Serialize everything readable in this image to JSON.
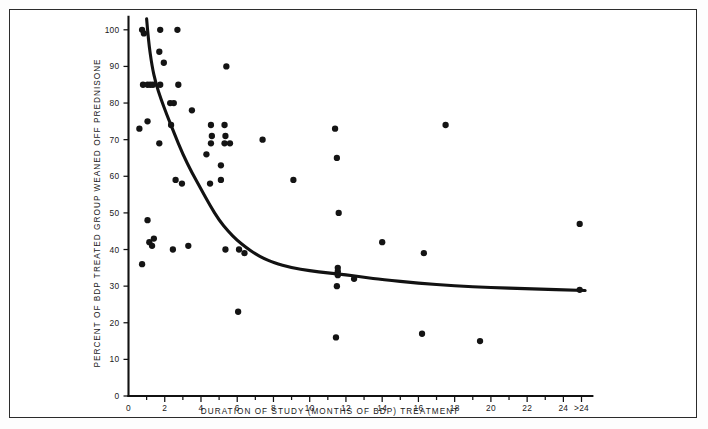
{
  "figure": {
    "border_color": "#2b2b2b",
    "background": "#ffffff",
    "point_color": "#141414",
    "line_color": "#121212"
  },
  "chart_data": {
    "type": "scatter",
    "title": "",
    "subtitle": "",
    "xlabel": "DURATION OF STUDY  (MONTHS OF BDP)  TREATMENT",
    "ylabel": "PERCENT OF BDP TREATED GROUP WEANED OFF PREDNISONE",
    "xlim": [
      0,
      26
    ],
    "ylim": [
      0,
      103
    ],
    "grid": false,
    "legend": null,
    "x_ticks": [
      0,
      1,
      2,
      3,
      4,
      5,
      6,
      7,
      8,
      9,
      10,
      11,
      12,
      13,
      14,
      15,
      16,
      17,
      18,
      19,
      20,
      21,
      22,
      23,
      24,
      25
    ],
    "x_tick_labels": [
      "0",
      "",
      "2",
      "",
      "4",
      "",
      "6",
      "",
      "8",
      "",
      "10",
      "",
      "12",
      "",
      "14",
      "",
      "16",
      "",
      "18",
      "",
      "20",
      "",
      "22",
      "",
      "24",
      ">24"
    ],
    "y_ticks": [
      0,
      10,
      20,
      30,
      40,
      50,
      60,
      70,
      80,
      90,
      100
    ],
    "y_tick_labels": [
      "0",
      "10",
      "20",
      "30",
      "40",
      "50",
      "60",
      "70",
      "80",
      "90",
      "100"
    ],
    "points": [
      {
        "x": 0.75,
        "y": 100
      },
      {
        "x": 0.85,
        "y": 99
      },
      {
        "x": 0.8,
        "y": 85
      },
      {
        "x": 1.05,
        "y": 85
      },
      {
        "x": 1.2,
        "y": 85
      },
      {
        "x": 1.35,
        "y": 85
      },
      {
        "x": 0.6,
        "y": 73
      },
      {
        "x": 1.05,
        "y": 75
      },
      {
        "x": 1.05,
        "y": 48
      },
      {
        "x": 1.15,
        "y": 42
      },
      {
        "x": 1.3,
        "y": 41
      },
      {
        "x": 1.4,
        "y": 43
      },
      {
        "x": 0.75,
        "y": 36
      },
      {
        "x": 1.75,
        "y": 100
      },
      {
        "x": 1.7,
        "y": 94
      },
      {
        "x": 1.95,
        "y": 91
      },
      {
        "x": 1.75,
        "y": 85
      },
      {
        "x": 1.7,
        "y": 69
      },
      {
        "x": 2.3,
        "y": 80
      },
      {
        "x": 2.5,
        "y": 80
      },
      {
        "x": 2.35,
        "y": 74
      },
      {
        "x": 2.7,
        "y": 100
      },
      {
        "x": 2.75,
        "y": 85
      },
      {
        "x": 2.6,
        "y": 59
      },
      {
        "x": 2.45,
        "y": 40
      },
      {
        "x": 2.95,
        "y": 58
      },
      {
        "x": 3.5,
        "y": 78
      },
      {
        "x": 3.3,
        "y": 41
      },
      {
        "x": 4.55,
        "y": 74
      },
      {
        "x": 4.6,
        "y": 71
      },
      {
        "x": 4.55,
        "y": 69
      },
      {
        "x": 4.5,
        "y": 58
      },
      {
        "x": 4.3,
        "y": 66
      },
      {
        "x": 5.4,
        "y": 90
      },
      {
        "x": 5.3,
        "y": 74
      },
      {
        "x": 5.35,
        "y": 71
      },
      {
        "x": 5.3,
        "y": 69
      },
      {
        "x": 5.1,
        "y": 63
      },
      {
        "x": 5.6,
        "y": 69
      },
      {
        "x": 5.1,
        "y": 59
      },
      {
        "x": 5.35,
        "y": 40
      },
      {
        "x": 6.1,
        "y": 40
      },
      {
        "x": 6.4,
        "y": 39
      },
      {
        "x": 6.05,
        "y": 23
      },
      {
        "x": 7.4,
        "y": 70
      },
      {
        "x": 9.1,
        "y": 59
      },
      {
        "x": 11.4,
        "y": 73
      },
      {
        "x": 11.5,
        "y": 65
      },
      {
        "x": 11.6,
        "y": 50
      },
      {
        "x": 11.55,
        "y": 35
      },
      {
        "x": 11.55,
        "y": 34
      },
      {
        "x": 11.55,
        "y": 33
      },
      {
        "x": 11.5,
        "y": 30
      },
      {
        "x": 11.45,
        "y": 16
      },
      {
        "x": 12.45,
        "y": 32
      },
      {
        "x": 14.0,
        "y": 42
      },
      {
        "x": 16.3,
        "y": 39
      },
      {
        "x": 16.2,
        "y": 17
      },
      {
        "x": 17.5,
        "y": 74
      },
      {
        "x": 19.4,
        "y": 15
      },
      {
        "x": 24.9,
        "y": 47
      },
      {
        "x": 24.9,
        "y": 29
      }
    ],
    "fit_curve": {
      "label": "exponential decay fit",
      "x": [
        1.0,
        1.1,
        1.3,
        1.5,
        1.8,
        2.1,
        2.5,
        3.0,
        3.5,
        4.0,
        4.5,
        5.0,
        5.5,
        6.0,
        6.5,
        7.0,
        7.5,
        8.0,
        9.0,
        10.0,
        11.0,
        12.0,
        13.0,
        14.0,
        16.0,
        18.0,
        20.0,
        22.0,
        25.2
      ],
      "y": [
        103,
        97,
        90,
        85.5,
        81,
        77,
        72,
        66,
        61,
        56.5,
        52,
        48,
        45,
        42.5,
        40.5,
        38.8,
        37.5,
        36.4,
        35.0,
        34.2,
        33.6,
        33.1,
        32.4,
        31.8,
        30.8,
        30.1,
        29.6,
        29.3,
        28.8
      ]
    }
  }
}
